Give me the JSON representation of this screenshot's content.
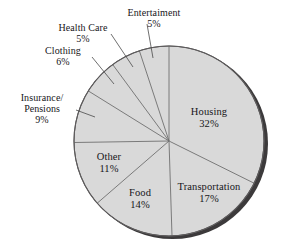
{
  "chart_data": {
    "type": "pie",
    "title": "",
    "subtitle": "",
    "xlabel": "",
    "ylabel": "",
    "legend_position": "none",
    "grid": false,
    "start_angle_deg": -90,
    "direction": "clockwise",
    "units": "percent",
    "categories": [
      "Housing",
      "Transportation",
      "Food",
      "Other",
      "Insurance/ Pensions",
      "Clothing",
      "Health Care",
      "Entertaiment"
    ],
    "values": [
      32,
      17,
      14,
      11,
      9,
      6,
      5,
      5
    ],
    "value_labels": [
      "32%",
      "17%",
      "14%",
      "11%",
      "9%",
      "6%",
      "5%",
      "5%"
    ],
    "slice_fill": "#d9d9d9",
    "slice_stroke": "#6f6f6f",
    "shadow_color": "#3c3a3b"
  },
  "slices": [
    {
      "id": "housing",
      "name": "Housing",
      "value_label": "32%",
      "placement": "inside"
    },
    {
      "id": "transportation",
      "name": "Transportation",
      "value_label": "17%",
      "placement": "inside"
    },
    {
      "id": "food",
      "name": "Food",
      "value_label": "14%",
      "placement": "inside"
    },
    {
      "id": "other",
      "name": "Other",
      "value_label": "11%",
      "placement": "inside"
    },
    {
      "id": "insurance-pensions",
      "name_line1": "Insurance/",
      "name_line2": "Pensions",
      "value_label": "9%",
      "placement": "outside-leader"
    },
    {
      "id": "clothing",
      "name": "Clothing",
      "value_label": "6%",
      "placement": "outside-leader"
    },
    {
      "id": "health-care",
      "name": "Health Care",
      "value_label": "5%",
      "placement": "outside-leader"
    },
    {
      "id": "entertainment",
      "name": "Entertaiment",
      "value_label": "5%",
      "placement": "outside-leader"
    }
  ]
}
